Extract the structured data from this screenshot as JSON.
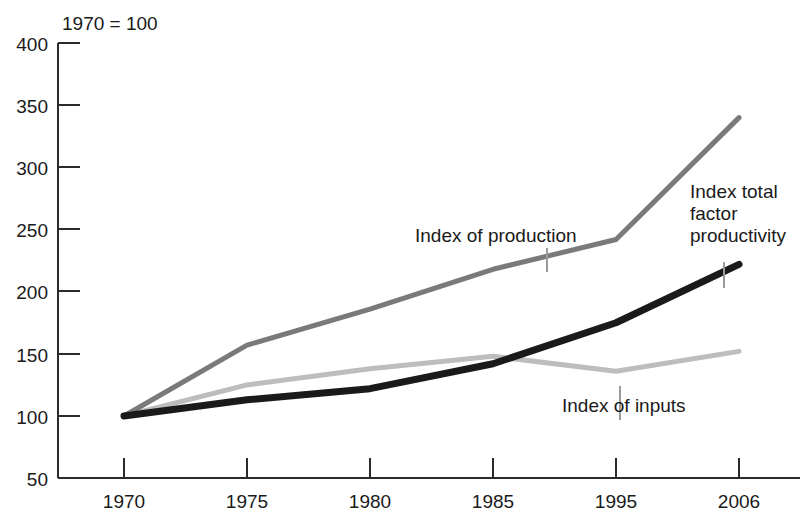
{
  "chart_data": {
    "type": "line",
    "title": "1970 = 100",
    "xlabel": "",
    "ylabel": "",
    "ylim": [
      50,
      400
    ],
    "yticks": [
      50,
      100,
      150,
      200,
      250,
      300,
      350,
      400
    ],
    "categories": [
      "1970",
      "1975",
      "1980",
      "1985",
      "1995",
      "2006"
    ],
    "grid": false,
    "legend_position": "inline-annotations",
    "series": [
      {
        "name": "Index of production",
        "color": "#7a7a7a",
        "values": [
          100,
          157,
          186,
          218,
          242,
          340
        ]
      },
      {
        "name": "Index total factor productivity",
        "color": "#1a1a1a",
        "values": [
          100,
          113,
          122,
          142,
          175,
          222
        ]
      },
      {
        "name": "Index of inputs",
        "color": "#bdbdbd",
        "values": [
          100,
          125,
          138,
          148,
          136,
          152
        ]
      }
    ],
    "annotations": [
      {
        "text": "Index of production",
        "series": "Index of production",
        "lines": [
          "Index of production"
        ]
      },
      {
        "text": "Index total factor productivity",
        "series": "Index total factor productivity",
        "lines": [
          "Index total",
          "factor",
          "productivity"
        ]
      },
      {
        "text": "Index of inputs",
        "series": "Index of inputs",
        "lines": [
          "Index of inputs"
        ]
      }
    ]
  },
  "axis": {
    "y_tick_400": "400",
    "y_tick_350": "350",
    "y_tick_300": "300",
    "y_tick_250": "250",
    "y_tick_200": "200",
    "y_tick_150": "150",
    "y_tick_100": "100",
    "y_tick_50": "50",
    "x_tick_1970": "1970",
    "x_tick_1975": "1975",
    "x_tick_1980": "1980",
    "x_tick_1985": "1985",
    "x_tick_1995": "1995",
    "x_tick_2006": "2006"
  },
  "labels": {
    "index_note": "1970 = 100",
    "production": "Index of production",
    "tfp_line1": "Index total",
    "tfp_line2": "factor",
    "tfp_line3": "productivity",
    "inputs": "Index of inputs"
  }
}
